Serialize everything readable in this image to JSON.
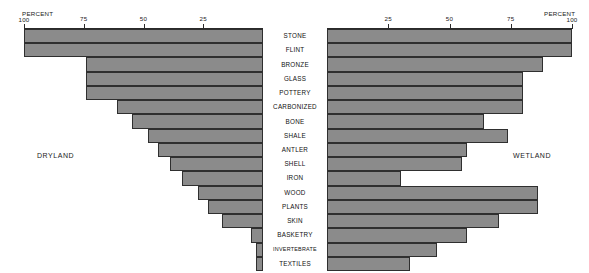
{
  "figure": {
    "left_panel_label": "DRYLAND",
    "right_panel_label": "WETLAND",
    "axis_title_left": "PERCENT",
    "axis_title_right": "PERCENT"
  },
  "chart_data": {
    "type": "bar",
    "orientation": "horizontal",
    "layout": "diverging-pyramid",
    "title": "",
    "xlabel": "PERCENT",
    "ylabel": "",
    "xlim": [
      0,
      100
    ],
    "grid": false,
    "legend": "none",
    "categories": [
      "STONE",
      "FLINT",
      "BRONZE",
      "GLASS",
      "POTTERY",
      "CARBONIZED",
      "BONE",
      "SHALE",
      "ANTLER",
      "SHELL",
      "IRON",
      "WOOD",
      "PLANTS",
      "SKIN",
      "BASKETRY",
      "INVERTEBRATE",
      "TEXTILES"
    ],
    "series": [
      {
        "name": "DRYLAND",
        "side": "left",
        "axis_ticks": [
          100,
          75,
          50,
          25
        ],
        "axis_direction": "100-at-outer-edge",
        "values": [
          100,
          100,
          74,
          74,
          74,
          61,
          55,
          48,
          44,
          39,
          34,
          27,
          23,
          17,
          5,
          3,
          3
        ]
      },
      {
        "name": "WETLAND",
        "side": "right",
        "axis_ticks": [
          25,
          50,
          75,
          100
        ],
        "axis_direction": "100-at-outer-edge",
        "values": [
          100,
          100,
          88,
          80,
          80,
          80,
          64,
          74,
          57,
          55,
          30,
          86,
          86,
          70,
          57,
          45,
          34
        ]
      }
    ]
  }
}
